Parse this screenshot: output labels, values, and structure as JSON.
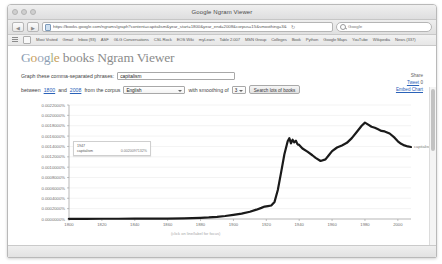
{
  "window": {
    "title": "Google Ngram Viewer",
    "traffic_lights": [
      "close",
      "minimize",
      "zoom"
    ]
  },
  "toolbar": {
    "back_label": "◀",
    "forward_label": "▶",
    "url": "https://books.google.com/ngrams/graph?content=capitalism&year_start=1800&year_end=2008&corpus=15&smoothing=3&",
    "reload_label": "↻",
    "search_placeholder": "Google",
    "lock_icon": "lock-icon"
  },
  "bookmarks": [
    "Most Visited",
    "Gmail",
    "Inbox (93)",
    "ASF",
    "GLG Conversations",
    "CSL Rock",
    "EOS Wiki",
    "myLearn",
    "Table 2.007",
    "MSN Group",
    "Colleges",
    "Book",
    "Python",
    "Google Maps",
    "YouTube",
    "Wikipedia",
    "News (337)"
  ],
  "site": {
    "logo_parts": [
      "G",
      "o",
      "o",
      "g",
      "l",
      "e"
    ],
    "logo_rest": " books Ngram Viewer"
  },
  "form": {
    "graph_label": "Graph these comma-separated phrases:",
    "phrase_value": "capitalism",
    "between_label": "between",
    "year_start": "1800",
    "and_label": "and",
    "year_end": "2008",
    "corpus_label": "from the corpus",
    "corpus_value": "English",
    "smoothing_label": "with smoothing of",
    "smoothing_value": "3",
    "search_button": "Search lots of books"
  },
  "rail": {
    "share_label": "Share",
    "tweet_label": "Tweet",
    "tweet_count": "0",
    "embed_label": "Embed Chart"
  },
  "tooltip": {
    "year": "1947",
    "series": "capitalism",
    "value": "0.0020097132%"
  },
  "series_label": "capitalism",
  "chart_data": {
    "type": "line",
    "title": "",
    "xlabel": "(click on line/label for focus)",
    "ylabel": "",
    "xlim": [
      1800,
      2008
    ],
    "ylim": [
      0,
      0.0022
    ],
    "grid": true,
    "legend_position": "right-inline",
    "ytick_labels": [
      "0.0022000%",
      "0.0020000%",
      "0.0018000%",
      "0.0016000%",
      "0.0014000%",
      "0.0012000%",
      "0.0010000%",
      "0.0008000%",
      "0.0006000%",
      "0.0004000%",
      "0.0002000%",
      "0.0000000%"
    ],
    "ytick_values": [
      0.0022,
      0.002,
      0.0018,
      0.0016,
      0.0014,
      0.0012,
      0.001,
      0.0008,
      0.0006,
      0.0004,
      0.0002,
      0.0
    ],
    "xtick_labels": [
      "1800",
      "1820",
      "1840",
      "1860",
      "1880",
      "1900",
      "1920",
      "1940",
      "1960",
      "1980",
      "2000"
    ],
    "xtick_values": [
      1800,
      1820,
      1840,
      1860,
      1880,
      1900,
      1920,
      1940,
      1960,
      1980,
      2000
    ],
    "series": [
      {
        "name": "capitalism",
        "color": "#1a1a1a",
        "x": [
          1800,
          1810,
          1820,
          1830,
          1840,
          1850,
          1860,
          1870,
          1875,
          1880,
          1885,
          1890,
          1895,
          1900,
          1905,
          1910,
          1914,
          1917,
          1919,
          1921,
          1923,
          1925,
          1927,
          1929,
          1931,
          1933,
          1934,
          1935,
          1936,
          1937,
          1938,
          1939,
          1940,
          1942,
          1945,
          1948,
          1950,
          1953,
          1956,
          1958,
          1960,
          1963,
          1966,
          1969,
          1972,
          1975,
          1978,
          1980,
          1982,
          1984,
          1986,
          1988,
          1990,
          1992,
          1995,
          1998,
          2000,
          2002,
          2004,
          2006,
          2008
        ],
        "y": [
          4e-06,
          4e-06,
          5e-06,
          5e-06,
          6e-06,
          7e-06,
          9e-06,
          1.3e-05,
          1.6e-05,
          2.2e-05,
          3e-05,
          4.2e-05,
          5.8e-05,
          8e-05,
          0.000105,
          0.00014,
          0.00018,
          0.000215,
          0.00024,
          0.00025,
          0.00026,
          0.00033,
          0.00056,
          0.0009,
          0.00125,
          0.0015,
          0.00156,
          0.00146,
          0.00153,
          0.00148,
          0.00151,
          0.00144,
          0.00143,
          0.00136,
          0.0013,
          0.00123,
          0.00118,
          0.00112,
          0.00115,
          0.00123,
          0.00131,
          0.00138,
          0.00142,
          0.00147,
          0.00156,
          0.00168,
          0.0018,
          0.00186,
          0.00182,
          0.00178,
          0.00176,
          0.00173,
          0.0017,
          0.00169,
          0.00165,
          0.00157,
          0.0015,
          0.00145,
          0.00142,
          0.0014,
          0.00139
        ]
      }
    ]
  }
}
